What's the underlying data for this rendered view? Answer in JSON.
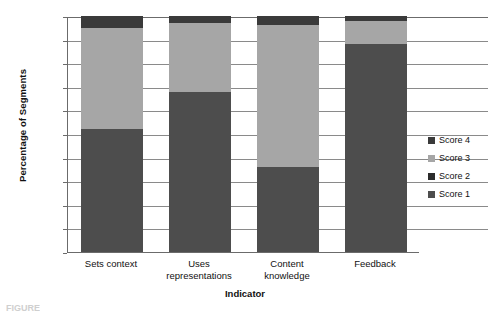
{
  "chart_data": {
    "type": "bar",
    "stacked": true,
    "title": "",
    "xlabel": "Indicator",
    "ylabel": "Percentage of Segments",
    "categories": [
      "Sets context",
      "Uses representations",
      "Content knowledge",
      "Feedback"
    ],
    "category_lines": [
      [
        "Sets context"
      ],
      [
        "Uses",
        "representations"
      ],
      [
        "Content",
        "knowledge"
      ],
      [
        "Feedback"
      ]
    ],
    "ylim": [
      0,
      100
    ],
    "yticks": [
      0,
      10,
      20,
      30,
      40,
      50,
      60,
      70,
      80,
      90,
      100
    ],
    "ytick_labels": [
      "0%",
      "10%",
      "20%",
      "30%",
      "40%",
      "50%",
      "60%",
      "70%",
      "80%",
      "90%",
      "100%"
    ],
    "grid": true,
    "legend_position": "right",
    "legend_order": [
      "Score 4",
      "Score 3",
      "Score 2",
      "Score 1"
    ],
    "series": [
      {
        "name": "Score 1",
        "color": "#4d4d4d",
        "values": [
          52,
          68,
          36,
          88
        ]
      },
      {
        "name": "Score 2",
        "color": "#2b2b2b",
        "values": [
          0,
          0,
          0,
          0
        ]
      },
      {
        "name": "Score 3",
        "color": "#a6a6a6",
        "values": [
          43,
          29,
          60,
          10
        ]
      },
      {
        "name": "Score 4",
        "color": "#3a3a3a",
        "values": [
          5,
          3,
          4,
          2
        ]
      }
    ],
    "legend_entries": [
      {
        "label": "Score 4",
        "color": "#3a3a3a"
      },
      {
        "label": "Score 3",
        "color": "#a6a6a6"
      },
      {
        "label": "Score 2",
        "color": "#2b2b2b"
      },
      {
        "label": "Score 1",
        "color": "#4d4d4d"
      }
    ]
  },
  "caption": {
    "text": "FIGURE"
  }
}
